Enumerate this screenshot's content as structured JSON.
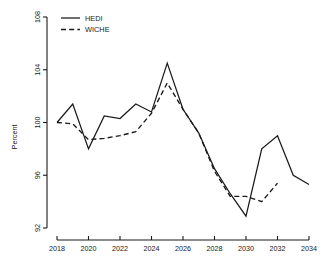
{
  "chart_data": {
    "type": "line",
    "title": "",
    "xlabel": "",
    "ylabel": "Percent",
    "xlim": [
      2018,
      2034
    ],
    "ylim": [
      92,
      108
    ],
    "grid": false,
    "legend_position": "top-left",
    "xticks": [
      "2018",
      "2020",
      "2022",
      "2024",
      "2026",
      "2028",
      "2030",
      "2032",
      "2034"
    ],
    "yticks": [
      "92",
      "96",
      "100",
      "104",
      "108"
    ],
    "x": [
      2018,
      2019,
      2020,
      2021,
      2022,
      2023,
      2024,
      2025,
      2026,
      2027,
      2028,
      2029,
      2030,
      2031,
      2032,
      2033,
      2034
    ],
    "series": [
      {
        "name": "HEDI",
        "style": "solid",
        "color": "#1a1a1a",
        "x": [
          2018,
          2019,
          2020,
          2021,
          2022,
          2023,
          2024,
          2025,
          2026,
          2027,
          2028,
          2029,
          2030,
          2031,
          2032,
          2033,
          2034
        ],
        "values": [
          100.0,
          101.4,
          98.0,
          100.5,
          100.3,
          101.4,
          100.8,
          104.5,
          101.0,
          99.2,
          96.5,
          94.6,
          92.9,
          98.0,
          99.0,
          96.0,
          95.3
        ]
      },
      {
        "name": "WICHE",
        "style": "dashed",
        "color": "#1a1a1a",
        "x": [
          2018,
          2019,
          2020,
          2021,
          2022,
          2023,
          2024,
          2025,
          2026,
          2027,
          2028,
          2029,
          2030,
          2031,
          2032
        ],
        "values": [
          100.0,
          99.9,
          98.7,
          98.8,
          99.0,
          99.3,
          100.7,
          103.0,
          101.0,
          99.2,
          96.3,
          94.4,
          94.4,
          94.0,
          95.4
        ]
      }
    ]
  },
  "legend": {
    "entries": [
      {
        "label": "HEDI",
        "style": "solid"
      },
      {
        "label": "WICHE",
        "style": "dashed"
      }
    ]
  },
  "axes": {
    "y_axis_title": "Percent"
  }
}
